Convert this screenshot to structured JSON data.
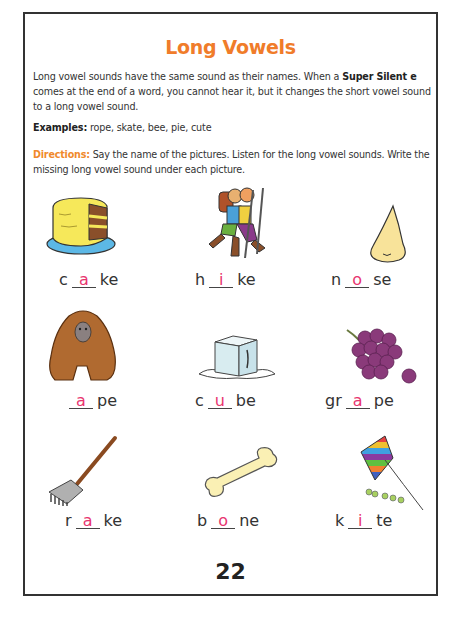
{
  "title": "Long Vowels",
  "intro": {
    "text_before": "Long vowel sounds have the same sound as their names. When a ",
    "bold": "Super Silent e",
    "text_after": " comes at the end of a word, you cannot hear it, but it changes the short vowel sound to a long vowel sound."
  },
  "examples": {
    "label": "Examples:",
    "text": " rope, skate, bee, pie, cute"
  },
  "directions": {
    "label": "Directions:",
    "text": " Say the name of the pictures. Listen for the long vowel sounds. Write the missing long vowel sound under each picture."
  },
  "colors": {
    "title": "#f07c2a",
    "directions_label": "#f08a2c",
    "answer_vowel": "#e8356f",
    "border": "#333333"
  },
  "items": [
    {
      "picture": "cake-icon",
      "prefix": "c",
      "vowel": "a",
      "suffix": "ke"
    },
    {
      "picture": "hikers-icon",
      "prefix": "h",
      "vowel": "i",
      "suffix": "ke"
    },
    {
      "picture": "nose-icon",
      "prefix": "n",
      "vowel": "o",
      "suffix": "se"
    },
    {
      "picture": "ape-icon",
      "prefix": "",
      "vowel": "a",
      "suffix": "pe"
    },
    {
      "picture": "ice-cube-icon",
      "prefix": "c",
      "vowel": "u",
      "suffix": "be"
    },
    {
      "picture": "grapes-icon",
      "prefix": "gr",
      "vowel": "a",
      "suffix": "pe"
    },
    {
      "picture": "rake-icon",
      "prefix": "r",
      "vowel": "a",
      "suffix": "ke"
    },
    {
      "picture": "bone-icon",
      "prefix": "b",
      "vowel": "o",
      "suffix": "ne"
    },
    {
      "picture": "kite-icon",
      "prefix": "k",
      "vowel": "i",
      "suffix": "te"
    }
  ],
  "page_number": "22"
}
